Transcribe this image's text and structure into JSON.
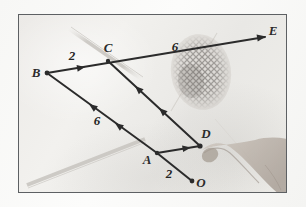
{
  "image": {
    "kind": "photograph-of-hand-drawn-vector-diagram",
    "medium": "pencil drawing on white paper, photographed",
    "frame_color": "#5d6063",
    "paper_color": "#efeeea",
    "ink_color": "#2b2b2b"
  },
  "diagram": {
    "type": "vector-addition-parallelogram",
    "points": [
      {
        "id": "B",
        "label": "B",
        "x": 28,
        "y": 58,
        "has_dot": true,
        "label_dx": -11,
        "label_dy": 4
      },
      {
        "id": "C",
        "label": "C",
        "x": 89,
        "y": 46,
        "has_dot": true,
        "label_dx": -3,
        "label_dy": -9
      },
      {
        "id": "E",
        "label": "E",
        "x": 246,
        "y": 21,
        "has_dot": false,
        "label_dx": 4,
        "label_dy": -1
      },
      {
        "id": "A",
        "label": "A",
        "x": 138,
        "y": 138,
        "has_dot": true,
        "label_dx": -13,
        "label_dy": 9
      },
      {
        "id": "D",
        "label": "D",
        "x": 181,
        "y": 131,
        "has_dot": true,
        "label_dx": 3,
        "label_dy": -8
      },
      {
        "id": "O",
        "label": "O",
        "x": 172,
        "y": 166,
        "has_dot": true,
        "label_dx": 6,
        "label_dy": 5
      }
    ],
    "segments": [
      {
        "id": "B-C-E",
        "from": "B",
        "to": "E",
        "via": "C",
        "arrowheads": [
          "mid-BC",
          "end-E"
        ],
        "style": "solid-dark"
      },
      {
        "id": "B-A",
        "from": "A",
        "to": "B",
        "arrowheads": [
          "two-mid"
        ],
        "style": "solid-dark"
      },
      {
        "id": "C-D",
        "from": "D",
        "to": "C",
        "arrowheads": [
          "two-mid"
        ],
        "style": "solid-dark"
      },
      {
        "id": "A-D",
        "from": "A",
        "to": "D",
        "arrowheads": [
          "mid"
        ],
        "style": "solid-dark"
      },
      {
        "id": "A-O",
        "from": "A",
        "to": "O",
        "arrowheads": [],
        "style": "solid-dark"
      }
    ],
    "measure_labels": [
      {
        "id": "bc-length",
        "text": "2",
        "x": 53,
        "y": 43
      },
      {
        "id": "ce-length",
        "text": "6",
        "x": 156,
        "y": 34
      },
      {
        "id": "ab-length",
        "text": "6",
        "x": 76,
        "y": 105
      },
      {
        "id": "ao-length",
        "text": "2",
        "x": 152,
        "y": 166
      }
    ]
  },
  "photo_elements": {
    "fingerprint": {
      "name": "fingerprint-smudge",
      "center_x": 182,
      "center_y": 57,
      "width": 58,
      "height": 74,
      "rotation_deg": -8
    },
    "hand": {
      "name": "hand-pointing-at-D",
      "description": "a hand with index finger touching point D from the lower right"
    },
    "pencil_lines": [
      {
        "id": "faint-line-upper",
        "x1": 50,
        "y1": 16,
        "x2": 120,
        "y2": 62
      },
      {
        "id": "faint-line-lower",
        "x1": 12,
        "y1": 168,
        "x2": 122,
        "y2": 126
      },
      {
        "id": "faint-line-right",
        "x1": 150,
        "y1": 90,
        "x2": 196,
        "y2": 20
      }
    ]
  }
}
